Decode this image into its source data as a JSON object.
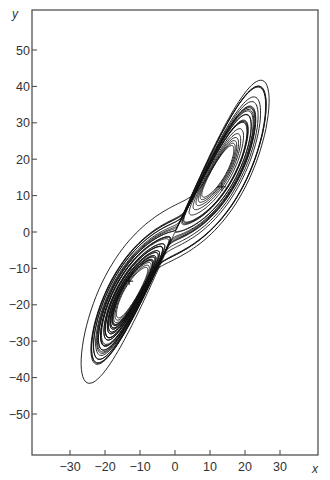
{
  "chart_data": {
    "type": "line",
    "title": "",
    "xlabel": "x",
    "ylabel": "y",
    "xlim": [
      -40,
      40
    ],
    "ylim": [
      -61,
      61
    ],
    "x_ticks": [
      -30,
      -20,
      -10,
      0,
      10,
      20,
      30
    ],
    "y_ticks": [
      50,
      40,
      30,
      20,
      10,
      0,
      -10,
      -20,
      -30,
      -40,
      -50
    ],
    "grid": false,
    "legend": null,
    "fixed_points": [
      {
        "x": 13.4,
        "y": 12.4,
        "marker": "+"
      },
      {
        "x": -13.1,
        "y": -13.5,
        "marker": "+"
      }
    ],
    "attractor_extent": {
      "x_min": -27,
      "x_max": 29.5,
      "y_min": -42,
      "y_max": 46
    },
    "series": [
      {
        "name": "trajectory",
        "model": "lorenz",
        "params": {
          "sigma": 10,
          "r": 28,
          "b": 2.6667
        },
        "plot_xy_scale": [
          1.55,
          1.6
        ],
        "initial": [
          1,
          1,
          20
        ],
        "dt": 0.005,
        "steps": 9000,
        "skip": 400
      }
    ]
  },
  "axes": {
    "x_label": "x",
    "y_label": "y"
  }
}
